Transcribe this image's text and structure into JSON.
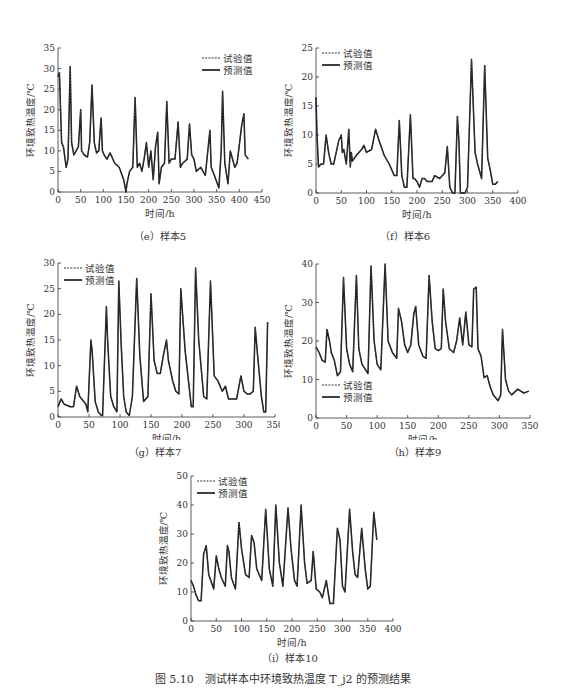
{
  "figure_caption": "图 5.10　测试样本中环境致热温度 T_j2 的预测结果",
  "legend": {
    "experimental": "试验值",
    "predicted": "预测值"
  },
  "chart_data": [
    {
      "id": "e",
      "type": "line",
      "subtitle": "（e）样本5",
      "xlabel": "时间/h",
      "ylabel": "环境致热温度/℃",
      "xlim": [
        0,
        450
      ],
      "ylim": [
        0,
        35
      ],
      "xticks": [
        0,
        50,
        100,
        150,
        200,
        250,
        300,
        350,
        400,
        450
      ],
      "yticks": [
        0,
        5,
        10,
        15,
        20,
        25,
        30,
        35
      ],
      "legend_position": "upper-right",
      "series": [
        {
          "name": "试验值",
          "style": "dashed"
        },
        {
          "name": "预测值",
          "style": "solid"
        }
      ],
      "x": [
        0,
        3,
        8,
        12,
        18,
        22,
        27,
        30,
        35,
        40,
        45,
        50,
        52,
        55,
        58,
        65,
        70,
        75,
        80,
        85,
        90,
        95,
        98,
        102,
        108,
        115,
        125,
        135,
        145,
        150,
        152,
        158,
        165,
        170,
        175,
        180,
        185,
        190,
        195,
        200,
        205,
        210,
        215,
        220,
        223,
        228,
        235,
        240,
        245,
        250,
        258,
        265,
        270,
        275,
        285,
        290,
        295,
        300,
        305,
        315,
        325,
        335,
        338,
        345,
        355,
        360,
        363,
        368,
        375,
        380,
        390,
        395,
        405,
        410,
        413,
        420
      ],
      "values": [
        28,
        29,
        12,
        11,
        6,
        8,
        30.5,
        12,
        9,
        10,
        11,
        20,
        10,
        9.5,
        9,
        8.5,
        12,
        26,
        12,
        9.5,
        10,
        18,
        10,
        9,
        8,
        9.5,
        7,
        6,
        3,
        0,
        2,
        5,
        6,
        23,
        6,
        7,
        5,
        8,
        12,
        6,
        10,
        3,
        11,
        14.5,
        2,
        6,
        7,
        22,
        7,
        8,
        8,
        17,
        6,
        7,
        8,
        16.5,
        9,
        8,
        5,
        6,
        4,
        15,
        6,
        4,
        1,
        10,
        24.5,
        7,
        2,
        10,
        6,
        7,
        16,
        19,
        9,
        8
      ]
    },
    {
      "id": "f",
      "type": "line",
      "subtitle": "（f）样本6",
      "xlabel": "时间/h",
      "ylabel": "环境致热温度/℃",
      "xlim": [
        0,
        400
      ],
      "ylim": [
        0,
        25
      ],
      "xticks": [
        0,
        50,
        100,
        150,
        200,
        250,
        300,
        350,
        400
      ],
      "yticks": [
        0,
        5,
        10,
        15,
        20,
        25
      ],
      "legend_position": "upper-left",
      "series": [
        {
          "name": "试验值",
          "style": "dashed"
        },
        {
          "name": "预测值",
          "style": "solid"
        }
      ],
      "x": [
        0,
        2,
        5,
        10,
        15,
        20,
        25,
        30,
        35,
        45,
        50,
        52,
        55,
        60,
        65,
        68,
        70,
        72,
        80,
        90,
        95,
        100,
        110,
        118,
        125,
        135,
        145,
        155,
        160,
        165,
        170,
        175,
        180,
        187,
        192,
        195,
        200,
        205,
        210,
        215,
        220,
        230,
        235,
        245,
        255,
        260,
        265,
        270,
        275,
        280,
        283,
        286,
        290,
        295,
        300,
        308,
        315,
        320,
        328,
        334,
        340,
        345,
        350,
        355,
        360
      ],
      "values": [
        16.5,
        10,
        4.5,
        5,
        5,
        10,
        7,
        5,
        5,
        9,
        10,
        7,
        7.5,
        5,
        11,
        4.5,
        7,
        5.5,
        6.5,
        7.5,
        8.2,
        7,
        7.5,
        11,
        9,
        6.5,
        5,
        3,
        3,
        12.5,
        3,
        1,
        1,
        13.5,
        2.5,
        2.5,
        2,
        1,
        2.5,
        2.5,
        2,
        2,
        3,
        2.5,
        3.5,
        8,
        1,
        0,
        0,
        13.2,
        9,
        0,
        0,
        0,
        1,
        23,
        7,
        5,
        2.5,
        22,
        6,
        4,
        1.5,
        1.5,
        2
      ]
    },
    {
      "id": "g",
      "type": "line",
      "subtitle": "（g）样本7",
      "xlabel": "时间/h",
      "ylabel": "环境致热温度/℃",
      "xlim": [
        0,
        350
      ],
      "ylim": [
        0,
        30
      ],
      "xticks": [
        0,
        50,
        100,
        150,
        200,
        250,
        300,
        350
      ],
      "yticks": [
        0,
        5,
        10,
        15,
        20,
        25,
        30
      ],
      "legend_position": "upper-left",
      "series": [
        {
          "name": "试验值",
          "style": "dashed"
        },
        {
          "name": "预测值",
          "style": "solid"
        }
      ],
      "x": [
        0,
        5,
        10,
        20,
        25,
        30,
        35,
        45,
        48,
        53,
        55,
        60,
        65,
        70,
        72,
        78,
        80,
        85,
        90,
        95,
        98,
        102,
        106,
        110,
        115,
        120,
        127,
        132,
        138,
        145,
        150,
        155,
        160,
        165,
        170,
        175,
        178,
        185,
        190,
        195,
        198,
        205,
        215,
        218,
        222,
        227,
        235,
        240,
        246,
        252,
        258,
        265,
        270,
        275,
        280,
        288,
        295,
        300,
        305,
        310,
        315,
        318,
        322,
        328,
        332,
        335,
        338
      ],
      "values": [
        2,
        3.5,
        2.5,
        2,
        2,
        6,
        4,
        2.5,
        1,
        15,
        13,
        3,
        1,
        0.3,
        0.3,
        21.5,
        15,
        4,
        2,
        1,
        26.5,
        14,
        4,
        1,
        0.3,
        4,
        27,
        12,
        3,
        4,
        24,
        11,
        8.5,
        8.5,
        12,
        15,
        11,
        7,
        5,
        4.5,
        25,
        13,
        2,
        2,
        29,
        15,
        4,
        3.5,
        26.5,
        8,
        7,
        5,
        6,
        3.5,
        3.5,
        3.5,
        8,
        5,
        4.5,
        4.5,
        5,
        17.5,
        12,
        4,
        1,
        1,
        18.5
      ]
    },
    {
      "id": "h",
      "type": "line",
      "subtitle": "（h）样本9",
      "xlabel": "时间/h",
      "ylabel": "环境致热温度/℃",
      "xlim": [
        0,
        350
      ],
      "ylim": [
        0,
        40
      ],
      "xticks": [
        0,
        50,
        100,
        150,
        200,
        250,
        300,
        350
      ],
      "yticks": [
        0,
        10,
        20,
        30,
        40
      ],
      "legend_position": "lower-left",
      "series": [
        {
          "name": "试验值",
          "style": "dashed"
        },
        {
          "name": "预测值",
          "style": "solid"
        }
      ],
      "x": [
        0,
        5,
        10,
        15,
        18,
        22,
        25,
        30,
        35,
        40,
        45,
        50,
        55,
        60,
        66,
        70,
        75,
        85,
        90,
        95,
        100,
        106,
        113,
        118,
        125,
        132,
        135,
        140,
        145,
        150,
        155,
        160,
        163,
        168,
        175,
        180,
        185,
        190,
        195,
        200,
        205,
        208,
        212,
        218,
        225,
        230,
        235,
        240,
        245,
        250,
        255,
        258,
        262,
        265,
        270,
        275,
        280,
        285,
        290,
        298,
        302,
        305,
        310,
        315,
        320,
        330,
        335,
        340,
        348
      ],
      "values": [
        18.5,
        17,
        15,
        14.5,
        23,
        20,
        17,
        15,
        11,
        12,
        36.5,
        18,
        14,
        12,
        37,
        18,
        14,
        11.5,
        39.5,
        20,
        14,
        12.5,
        40,
        20,
        17,
        15.5,
        28.5,
        25,
        19,
        17,
        19,
        27,
        29,
        19,
        16,
        15.5,
        37,
        25,
        18,
        17.5,
        18,
        33.5,
        25,
        18,
        17,
        20,
        26,
        19,
        27.5,
        19,
        18.5,
        33.5,
        34,
        18,
        16,
        10.5,
        11,
        8,
        6,
        4.5,
        6,
        23,
        10,
        7,
        6,
        7.5,
        7,
        6.5,
        7
      ]
    },
    {
      "id": "i",
      "type": "line",
      "subtitle": "（i）样本10",
      "xlabel": "时间/h",
      "ylabel": "环境致热温度/℃",
      "xlim": [
        0,
        400
      ],
      "ylim": [
        0,
        50
      ],
      "xticks": [
        0,
        50,
        100,
        150,
        200,
        250,
        300,
        350,
        400
      ],
      "yticks": [
        0,
        10,
        20,
        30,
        40,
        50
      ],
      "legend_position": "upper-left",
      "series": [
        {
          "name": "试验值",
          "style": "dashed"
        },
        {
          "name": "预测值",
          "style": "solid"
        }
      ],
      "x": [
        0,
        5,
        10,
        15,
        20,
        25,
        30,
        35,
        45,
        50,
        55,
        60,
        68,
        72,
        75,
        80,
        88,
        95,
        100,
        108,
        115,
        120,
        125,
        130,
        140,
        148,
        155,
        162,
        168,
        175,
        182,
        192,
        198,
        205,
        210,
        218,
        225,
        230,
        238,
        242,
        248,
        255,
        260,
        268,
        275,
        282,
        290,
        295,
        300,
        305,
        314,
        320,
        325,
        330,
        338,
        345,
        350,
        355,
        362,
        368
      ],
      "values": [
        14,
        12,
        9,
        7,
        7,
        23,
        26,
        16,
        11,
        22.5,
        18,
        15,
        12,
        26,
        24,
        15,
        11,
        34,
        25,
        16,
        15,
        29.5,
        27,
        18,
        14,
        38.5,
        18,
        12,
        40,
        20,
        12,
        39,
        25,
        14,
        12,
        40,
        20,
        13,
        14,
        24,
        11,
        10,
        8,
        14,
        6,
        6,
        32,
        28,
        12,
        10,
        38.5,
        24,
        16,
        15,
        32,
        18,
        11,
        12,
        37.5,
        28
      ]
    }
  ]
}
